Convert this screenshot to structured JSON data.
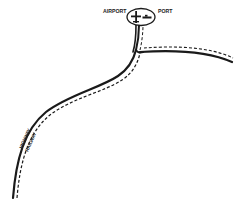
{
  "map": {
    "labels": {
      "airport": "AIRPORT",
      "port": "PORT",
      "highway": "HIGHWAY",
      "railway": "RAILWAY"
    },
    "icons": {
      "airport_symbol": "airplane-icon",
      "port_symbol": "ship-icon"
    },
    "routes": [
      {
        "name": "highway",
        "style": "solid"
      },
      {
        "name": "railway",
        "style": "dashed"
      }
    ],
    "colors": {
      "line": "#1a1a1a",
      "background": "#ffffff"
    }
  }
}
